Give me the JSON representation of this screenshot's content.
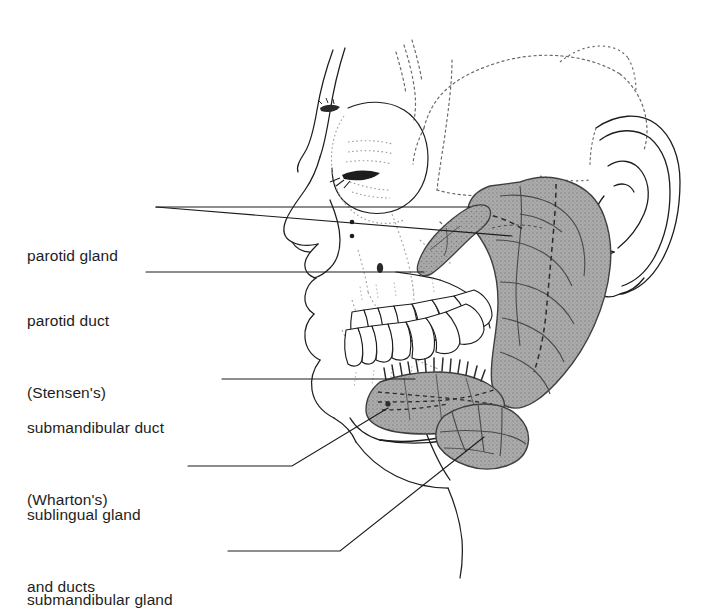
{
  "figure": {
    "view": "right lateral view of human head showing skull, teeth and salivary glands",
    "background_color": "#ffffff",
    "line_color": "#1d1d1d",
    "gland_fill_color": "#a6a6a6",
    "gland_outline_color": "#4a4a4a",
    "suture_color": "#6b6b6b"
  },
  "labels": [
    {
      "name": "parotid-gland",
      "line1": "parotid gland",
      "line2": "",
      "leader": "horizontal line from label to parotid gland body"
    },
    {
      "name": "parotid-duct",
      "line1": "parotid duct",
      "line2": "(Stensen's)",
      "leader": "horizontal line from label to parotid duct"
    },
    {
      "name": "submandibular-duct",
      "line1": "submandibular duct",
      "line2": "(Wharton's)",
      "leader": "horizontal line from label to submandibular duct"
    },
    {
      "name": "sublingual-gland",
      "line1": "sublingual gland",
      "line2": "and ducts",
      "leader": "horizontal then diagonal line up to sublingual gland"
    },
    {
      "name": "submandibular-gland",
      "line1": "submandibular gland",
      "line2": "",
      "leader": "horizontal then diagonal line up to submandibular gland"
    }
  ],
  "structures": [
    {
      "name": "parotid-gland",
      "shaded": true
    },
    {
      "name": "parotid-duct",
      "shaded": true
    },
    {
      "name": "sublingual-gland",
      "shaded": true
    },
    {
      "name": "submandibular-gland",
      "shaded": true
    },
    {
      "name": "skull-outline",
      "shaded": false
    },
    {
      "name": "ear",
      "shaded": false
    },
    {
      "name": "teeth",
      "shaded": false
    },
    {
      "name": "mandible",
      "shaded": false
    }
  ]
}
